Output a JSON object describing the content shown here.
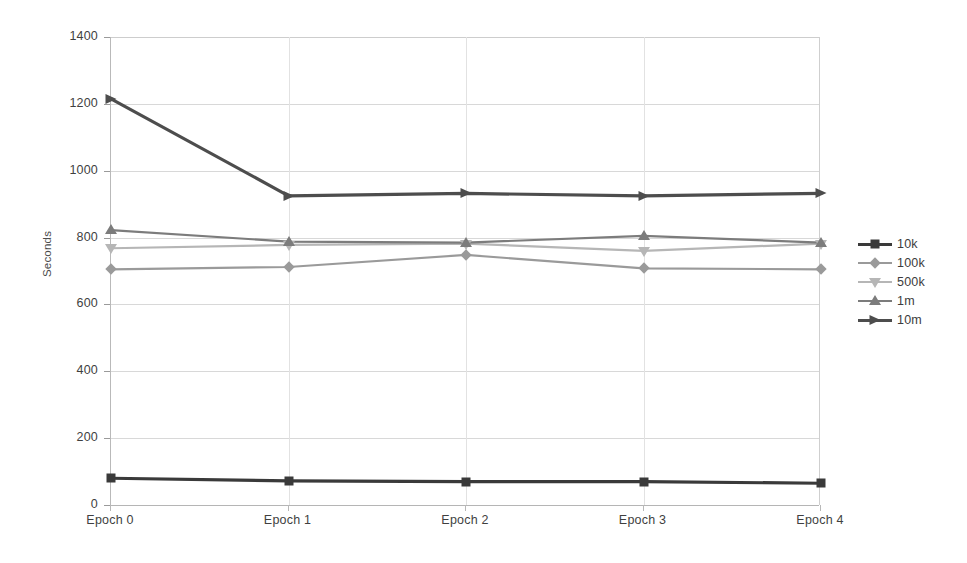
{
  "chart_data": {
    "type": "line",
    "title": "",
    "xlabel": "",
    "ylabel": "Seconds",
    "categories": [
      "Epoch 0",
      "Epoch 1",
      "Epoch 2",
      "Epoch 3",
      "Epoch 4"
    ],
    "ylim": [
      0,
      1400
    ],
    "ytick_labels": [
      "0",
      "200",
      "400",
      "600",
      "800",
      "1000",
      "1200",
      "1400"
    ],
    "ytick_values": [
      0,
      200,
      400,
      600,
      800,
      1000,
      1200,
      1400
    ],
    "ytick_interval": 200,
    "grid": "horizontal",
    "legend_position": "right",
    "series": [
      {
        "name": "10k",
        "values": [
          80,
          72,
          70,
          70,
          65
        ],
        "color": "#3a3a3a",
        "marker": "square"
      },
      {
        "name": "100k",
        "values": [
          705,
          712,
          748,
          708,
          705
        ],
        "color": "#9a9a9a",
        "marker": "diamond"
      },
      {
        "name": "500k",
        "values": [
          768,
          778,
          782,
          760,
          782
        ],
        "color": "#b6b6b6",
        "marker": "triangle-down"
      },
      {
        "name": "1m",
        "values": [
          822,
          788,
          785,
          805,
          785
        ],
        "color": "#7c7c7c",
        "marker": "triangle-up"
      },
      {
        "name": "10m",
        "values": [
          1215,
          925,
          932,
          925,
          932
        ],
        "color": "#4d4d4d",
        "marker": "triangle-right"
      }
    ]
  },
  "legend": {
    "items": [
      {
        "label": "10k"
      },
      {
        "label": "100k"
      },
      {
        "label": "500k"
      },
      {
        "label": "1m"
      },
      {
        "label": "10m"
      }
    ]
  },
  "axis": {
    "y_title": "Seconds"
  }
}
